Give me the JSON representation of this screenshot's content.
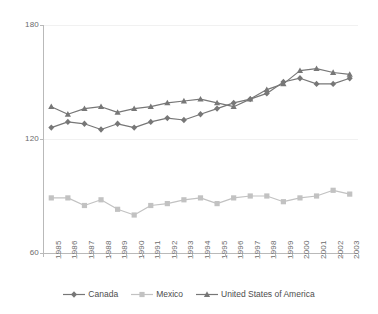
{
  "chart_data": {
    "type": "line",
    "title": "",
    "subtitle": "",
    "xlabel": "",
    "ylabel": "",
    "xlim": [
      1985,
      2003
    ],
    "ylim": [
      60,
      180
    ],
    "y_ticks": [
      60,
      120,
      180
    ],
    "grid": true,
    "legend_position": "bottom",
    "categories": [
      "1985",
      "1986",
      "1987",
      "1988",
      "1989",
      "1990",
      "1991",
      "1992",
      "1993",
      "1994",
      "1995",
      "1996",
      "1997",
      "1998",
      "1999",
      "2000",
      "2001",
      "2002",
      "2003"
    ],
    "series": [
      {
        "name": "Canada",
        "color": "#777777",
        "marker": "diamond",
        "values": [
          126,
          129,
          128,
          125,
          128,
          126,
          129,
          131,
          130,
          133,
          136,
          139,
          141,
          144,
          150,
          152,
          149,
          149,
          152
        ]
      },
      {
        "name": "Mexico",
        "color": "#c2c2c2",
        "marker": "square",
        "values": [
          89,
          89,
          85,
          88,
          83,
          80,
          85,
          86,
          88,
          89,
          86,
          89,
          90,
          90,
          87,
          89,
          90,
          93,
          91
        ]
      },
      {
        "name": "United States of America",
        "color": "#777777",
        "marker": "triangle",
        "values": [
          137,
          133,
          136,
          137,
          134,
          136,
          137,
          139,
          140,
          141,
          139,
          137,
          141,
          146,
          149,
          156,
          157,
          155,
          154
        ]
      }
    ]
  },
  "legend": {
    "entries": [
      {
        "label": "Canada"
      },
      {
        "label": "Mexico"
      },
      {
        "label": "United States of America"
      }
    ]
  },
  "axes": {
    "y_tick_labels": [
      "180",
      "120",
      "60"
    ]
  }
}
